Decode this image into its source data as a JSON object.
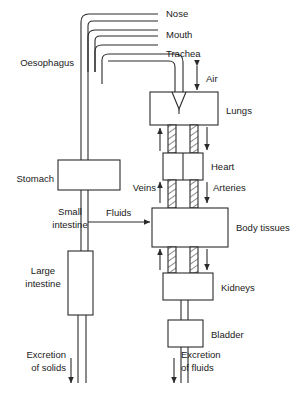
{
  "diagram": {
    "type": "flow-diagram",
    "stroke_color": "#2b2b2b",
    "background_color": "#ffffff",
    "labels": {
      "nose": "Nose",
      "mouth": "Mouth",
      "trachea": "Trachea",
      "oesophagus": "Oesophagus",
      "air": "Air",
      "lungs": "Lungs",
      "heart": "Heart",
      "stomach": "Stomach",
      "veins": "Veins",
      "arteries": "Arteries",
      "small_intestine_line1": "Small",
      "small_intestine_line2": "intestine",
      "fluids": "Fluids",
      "body_tissues": "Body tissues",
      "large_intestine_line1": "Large",
      "large_intestine_line2": "intestine",
      "kidneys": "Kidneys",
      "bladder": "Bladder",
      "excretion_solids_line1": "Excretion",
      "excretion_solids_line2": "of solids",
      "excretion_fluids_line1": "Excretion",
      "excretion_fluids_line2": "of fluids"
    },
    "organs": [
      {
        "id": "lungs",
        "label": "Lungs"
      },
      {
        "id": "heart",
        "label": "Heart"
      },
      {
        "id": "stomach",
        "label": "Stomach"
      },
      {
        "id": "body-tissues",
        "label": "Body tissues"
      },
      {
        "id": "large-intestine",
        "label": "Large intestine"
      },
      {
        "id": "kidneys",
        "label": "Kidneys"
      },
      {
        "id": "bladder",
        "label": "Bladder"
      }
    ],
    "flows": [
      {
        "id": "air",
        "label": "Air",
        "direction": "bidirectional"
      },
      {
        "id": "veins",
        "label": "Veins",
        "direction": "up"
      },
      {
        "id": "arteries",
        "label": "Arteries",
        "direction": "down"
      },
      {
        "id": "fluids",
        "label": "Fluids",
        "direction": "right"
      },
      {
        "id": "excretion-solids",
        "label": "Excretion of solids",
        "direction": "down"
      },
      {
        "id": "excretion-fluids",
        "label": "Excretion of fluids",
        "direction": "down"
      }
    ]
  }
}
